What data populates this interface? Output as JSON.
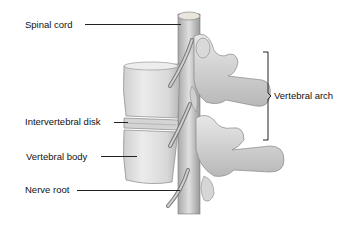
{
  "diagram": {
    "labels": {
      "spinal_cord": "Spinal cord",
      "vertebral_arch": "Vertebral arch",
      "intervertebral_disk": "Intervertebral disk",
      "vertebral_body": "Vertebral body",
      "nerve_root": "Nerve root"
    }
  },
  "colors": {
    "background": "#ffffff",
    "bone_light": "#e6e6e6",
    "bone_mid": "#c8c8c8",
    "bone_shadow": "#8c8c8c",
    "line": "#222222",
    "text": "#111111"
  }
}
